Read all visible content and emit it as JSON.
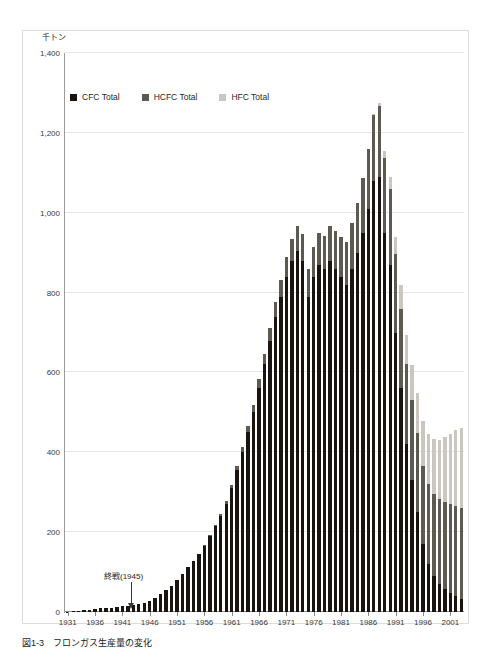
{
  "figure": {
    "caption_number": "図1-3",
    "caption_text": "フロンガス生産量の変化",
    "y_unit_label": "千トン"
  },
  "legend": {
    "position": "top-left-inside",
    "items": [
      {
        "label": "CFC Total",
        "color": "#1a1410",
        "icon": "square-swatch-icon"
      },
      {
        "label": "HCFC Total",
        "color": "#5d5a52",
        "icon": "square-swatch-icon"
      },
      {
        "label": "HFC Total",
        "color": "#c9c7bf",
        "icon": "square-swatch-icon"
      }
    ]
  },
  "annotation": {
    "text": "終戦(1945)",
    "target_year": 1945,
    "marker": "down-arrow-icon"
  },
  "chart_data": {
    "type": "bar",
    "stacked": true,
    "title": "フロンガス生産量の変化",
    "xlabel": "",
    "ylabel": "千トン",
    "ylim": [
      0,
      1400
    ],
    "ytick_values": [
      0,
      200,
      400,
      600,
      800,
      1000,
      1200,
      1400
    ],
    "ytick_labels": [
      "0",
      "200",
      "400",
      "600",
      "800",
      "1,000",
      "1,200",
      "1,400"
    ],
    "xlim": [
      1931,
      2003
    ],
    "xtick_labels": [
      "1931",
      "1936",
      "1941",
      "1946",
      "1951",
      "1956",
      "1961",
      "1966",
      "1971",
      "1976",
      "1981",
      "1986",
      "1991",
      "1996",
      "2001"
    ],
    "grid": "horizontal",
    "categories": [
      1931,
      1932,
      1933,
      1934,
      1935,
      1936,
      1937,
      1938,
      1939,
      1940,
      1941,
      1942,
      1943,
      1944,
      1945,
      1946,
      1947,
      1948,
      1949,
      1950,
      1951,
      1952,
      1953,
      1954,
      1955,
      1956,
      1957,
      1958,
      1959,
      1960,
      1961,
      1962,
      1963,
      1964,
      1965,
      1966,
      1967,
      1968,
      1969,
      1970,
      1971,
      1972,
      1973,
      1974,
      1975,
      1976,
      1977,
      1978,
      1979,
      1980,
      1981,
      1982,
      1983,
      1984,
      1985,
      1986,
      1987,
      1988,
      1989,
      1990,
      1991,
      1992,
      1993,
      1994,
      1995,
      1996,
      1997,
      1998,
      1999,
      2000,
      2001,
      2002,
      2003
    ],
    "series": [
      {
        "name": "CFC Total",
        "color": "#1a1410",
        "values": [
          1,
          2,
          3,
          4,
          5,
          7,
          9,
          10,
          11,
          12,
          14,
          16,
          18,
          20,
          22,
          28,
          36,
          45,
          55,
          66,
          80,
          96,
          112,
          128,
          145,
          165,
          190,
          215,
          240,
          270,
          310,
          355,
          400,
          450,
          500,
          560,
          620,
          680,
          740,
          790,
          840,
          880,
          905,
          880,
          790,
          840,
          870,
          860,
          880,
          860,
          840,
          820,
          860,
          900,
          950,
          1010,
          1080,
          1090,
          950,
          870,
          700,
          560,
          420,
          330,
          250,
          170,
          120,
          90,
          70,
          58,
          48,
          40,
          32
        ]
      },
      {
        "name": "HCFC Total",
        "color": "#5d5a52",
        "values": [
          0,
          0,
          0,
          0,
          0,
          0,
          0,
          0,
          0,
          0,
          0,
          0,
          0,
          0,
          0,
          0,
          0,
          0,
          0,
          0,
          0,
          0,
          0,
          0,
          1,
          2,
          3,
          4,
          5,
          7,
          9,
          11,
          13,
          16,
          19,
          23,
          27,
          31,
          36,
          42,
          48,
          55,
          62,
          68,
          70,
          74,
          78,
          82,
          88,
          94,
          100,
          106,
          114,
          124,
          136,
          150,
          166,
          178,
          186,
          190,
          196,
          200,
          202,
          200,
          198,
          196,
          200,
          206,
          212,
          218,
          222,
          226,
          228
        ]
      },
      {
        "name": "HFC Total",
        "color": "#c9c7bf",
        "values": [
          0,
          0,
          0,
          0,
          0,
          0,
          0,
          0,
          0,
          0,
          0,
          0,
          0,
          0,
          0,
          0,
          0,
          0,
          0,
          0,
          0,
          0,
          0,
          0,
          0,
          0,
          0,
          0,
          0,
          0,
          0,
          0,
          0,
          0,
          0,
          0,
          0,
          0,
          0,
          0,
          0,
          0,
          0,
          0,
          0,
          0,
          0,
          0,
          0,
          0,
          0,
          0,
          0,
          0,
          0,
          0,
          2,
          8,
          18,
          30,
          44,
          58,
          72,
          88,
          100,
          112,
          126,
          138,
          150,
          162,
          176,
          190,
          200
        ]
      }
    ],
    "totals_note": "Stacked totals peak at approximately 1,300 thousand tonnes in 1988."
  }
}
